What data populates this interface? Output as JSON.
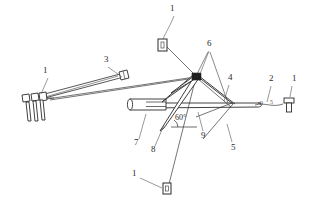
{
  "drawing": {
    "title": "Patent figure - guyed mast / tensioned boom assembly",
    "style": {
      "line_color": "#2b2b2b",
      "thin_line_color": "#555555",
      "background": "#ffffff",
      "hatch_color": "#6b6b6b"
    },
    "angle_annotation": {
      "value": "60°",
      "x": 175,
      "y": 118
    },
    "callouts": [
      {
        "id": "c1",
        "label": "1",
        "x": 45,
        "y": 71,
        "leader": [
          [
            48,
            78
          ],
          [
            41,
            94
          ]
        ]
      },
      {
        "id": "c2",
        "label": "3",
        "x": 106,
        "y": 60,
        "leader": [
          [
            108,
            67
          ],
          [
            119,
            95
          ]
        ]
      },
      {
        "id": "c3",
        "label": "1",
        "x": 172,
        "y": 9,
        "leader": [
          [
            174,
            16
          ],
          [
            163,
            41
          ]
        ]
      },
      {
        "id": "c4",
        "label": "6",
        "x": 209,
        "y": 44,
        "leader": [
          [
            209,
            51
          ],
          [
            200,
            74
          ]
        ]
      },
      {
        "id": "c5",
        "label": "4",
        "x": 230,
        "y": 78,
        "leader": [
          [
            229,
            85
          ],
          [
            224,
            101
          ]
        ]
      },
      {
        "id": "c6",
        "label": "2",
        "x": 271,
        "y": 79,
        "leader": [
          [
            271,
            86
          ],
          [
            267,
            104
          ]
        ]
      },
      {
        "id": "c7",
        "label": "1",
        "x": 294,
        "y": 79,
        "leader": [
          [
            294,
            86
          ],
          [
            292,
            100
          ]
        ]
      },
      {
        "id": "c8",
        "label": "7",
        "x": 136,
        "y": 142,
        "leader": [
          [
            139,
            139
          ],
          [
            146,
            116
          ]
        ]
      },
      {
        "id": "c9",
        "label": "8",
        "x": 153,
        "y": 150,
        "leader": [
          [
            155,
            146
          ],
          [
            166,
            121
          ]
        ]
      },
      {
        "id": "c10",
        "label": "9",
        "x": 203,
        "y": 135,
        "leader": [
          [
            203,
            131
          ],
          [
            199,
            115
          ]
        ]
      },
      {
        "id": "c11",
        "label": "5",
        "x": 233,
        "y": 147,
        "leader": [
          [
            232,
            142
          ],
          [
            226,
            122
          ]
        ]
      },
      {
        "id": "c12",
        "label": "1",
        "x": 134,
        "y": 173,
        "leader": [
          [
            138,
            178
          ],
          [
            163,
            190
          ]
        ]
      }
    ],
    "small_marks": [
      {
        "label": "9",
        "x": 262,
        "y": 104
      },
      {
        "label": "5",
        "x": 272,
        "y": 103
      }
    ],
    "parts_present": [
      "1",
      "2",
      "3",
      "4",
      "5",
      "6",
      "7",
      "8",
      "9"
    ]
  }
}
